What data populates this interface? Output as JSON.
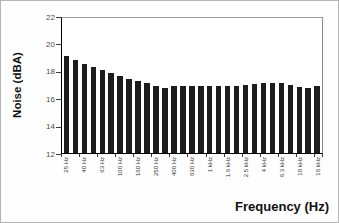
{
  "chart_data": {
    "type": "bar",
    "title": "",
    "ylabel": "Noise (dBA)",
    "xlabel": "Frequency (Hz)",
    "ylim": [
      12,
      22
    ],
    "yticks": [
      12,
      14,
      16,
      18,
      20,
      22
    ],
    "grid": false,
    "legend": "none",
    "bar_color": "#1d1d1d",
    "axis_color": "#000000",
    "tick_label_color": "#4d4d4d",
    "categories": [
      "25 Hz",
      "",
      "40 Hz",
      "",
      "63 Hz",
      "",
      "100 Hz",
      "",
      "160 Hz",
      "",
      "250 Hz",
      "",
      "400 Hz",
      "",
      "630 Hz",
      "",
      "1 kHz",
      "",
      "1.6 kHz",
      "",
      "2.5 kHz",
      "",
      "4 kHz",
      "",
      "6.3 kHz",
      "",
      "10 kHz",
      "",
      "16 kHz"
    ],
    "values": [
      19.2,
      18.9,
      18.6,
      18.35,
      18.15,
      17.95,
      17.7,
      17.5,
      17.35,
      17.2,
      17.0,
      16.85,
      17.0,
      17.0,
      17.0,
      17.0,
      17.0,
      17.0,
      17.0,
      17.0,
      17.05,
      17.1,
      17.15,
      17.15,
      17.15,
      17.05,
      16.9,
      16.85,
      16.95
    ]
  }
}
